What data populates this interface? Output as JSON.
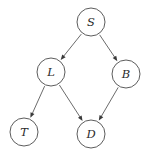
{
  "diagram": {
    "type": "directed-acyclic-graph",
    "title": "",
    "background_color": "#ffffff",
    "node_fill_color": "#ffffff",
    "node_stroke_color": "#4a4a4a",
    "edge_color": "#5a5a5a",
    "label_color": "#2b2b2b",
    "node_radius": 14,
    "nodes": [
      {
        "id": "S",
        "label": "S",
        "cx": 91,
        "cy": 22
      },
      {
        "id": "L",
        "label": "L",
        "cx": 51,
        "cy": 72
      },
      {
        "id": "B",
        "label": "B",
        "cx": 126,
        "cy": 74
      },
      {
        "id": "T",
        "label": "T",
        "cx": 24,
        "cy": 132
      },
      {
        "id": "D",
        "label": "D",
        "cx": 91,
        "cy": 134
      }
    ],
    "edges": [
      {
        "id": "S-L",
        "from": "S",
        "to": "L",
        "directed": true
      },
      {
        "id": "S-B",
        "from": "S",
        "to": "B",
        "directed": true
      },
      {
        "id": "L-T",
        "from": "L",
        "to": "T",
        "directed": true
      },
      {
        "id": "L-D",
        "from": "L",
        "to": "D",
        "directed": true
      },
      {
        "id": "B-D",
        "from": "B",
        "to": "D",
        "directed": true
      }
    ]
  }
}
